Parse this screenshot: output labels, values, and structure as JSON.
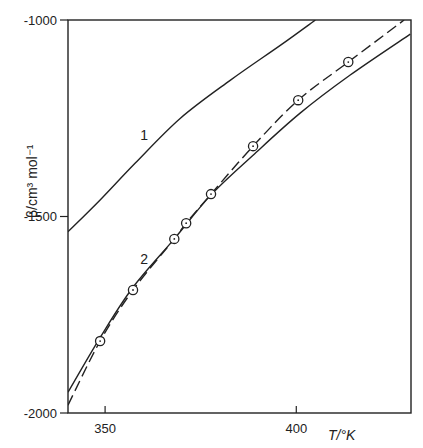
{
  "chart_data": {
    "type": "line",
    "title": "",
    "xlabel": "T/°K",
    "ylabel": "β/cm³ mol⁻¹",
    "xlim": [
      340.3,
      430
    ],
    "ylim": [
      -2000,
      -1000
    ],
    "x_ticks": [
      350,
      400
    ],
    "x_tick_labels": [
      "350",
      "400"
    ],
    "y_ticks": [
      -1000,
      -1500,
      -2000
    ],
    "y_tick_labels": [
      "-1000",
      "-1500",
      "-2000"
    ],
    "grid": false,
    "legend": "none",
    "series": [
      {
        "name": "1",
        "style": "solid",
        "x": [
          340.3,
          348.7,
          357.9,
          369.7,
          382.8,
          395.9,
          405.0
        ],
        "y": [
          -1539,
          -1458,
          -1364,
          -1250,
          -1153,
          -1064,
          -1000
        ]
      },
      {
        "name": "2",
        "style": "solid",
        "x": [
          340.3,
          348.7,
          357.3,
          368.1,
          377.7,
          388.7,
          401.0,
          414.1,
          429.8
        ],
        "y": [
          -1947,
          -1808,
          -1680,
          -1557,
          -1445,
          -1344,
          -1237,
          -1140,
          -1036
        ]
      },
      {
        "name": "2 (dashed)",
        "style": "dashed",
        "x": [
          340.3,
          348.7,
          357.3,
          368.1,
          371.2,
          377.7,
          388.7,
          400.5,
          413.6,
          428.2
        ],
        "y": [
          -1980,
          -1817,
          -1687,
          -1557,
          -1517,
          -1443,
          -1321,
          -1204,
          -1107,
          -1000
        ]
      },
      {
        "name": "experimental points",
        "style": "markers",
        "x": [
          348.7,
          357.3,
          368.1,
          371.2,
          377.7,
          388.7,
          400.5,
          413.6
        ],
        "y": [
          -1817,
          -1687,
          -1557,
          -1517,
          -1443,
          -1321,
          -1204,
          -1107
        ]
      }
    ],
    "annotations": [
      {
        "text": "1",
        "x": 360.2,
        "y": -1305
      },
      {
        "text": "2",
        "x": 360.2,
        "y": -1621
      }
    ]
  }
}
